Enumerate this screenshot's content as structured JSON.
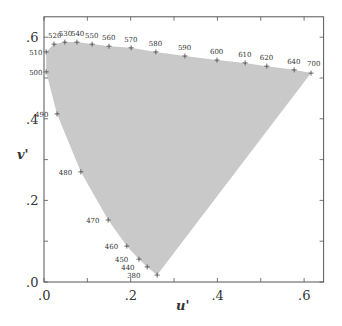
{
  "chart_data": {
    "type": "area",
    "title": "",
    "xlabel": "u'",
    "ylabel": "v'",
    "xlim": [
      0.0,
      0.645
    ],
    "ylim": [
      0.0,
      0.65
    ],
    "grid": false,
    "legend": null,
    "fill_color": "#c8c9c8",
    "x_ticks": [
      {
        "value": 0.0,
        "label": ".0"
      },
      {
        "value": 0.1,
        "label": ""
      },
      {
        "value": 0.2,
        "label": ".2"
      },
      {
        "value": 0.3,
        "label": ""
      },
      {
        "value": 0.4,
        "label": ".4"
      },
      {
        "value": 0.5,
        "label": ""
      },
      {
        "value": 0.6,
        "label": ".6"
      }
    ],
    "y_ticks": [
      {
        "value": 0.0,
        "label": ".0"
      },
      {
        "value": 0.1,
        "label": ""
      },
      {
        "value": 0.2,
        "label": ".2"
      },
      {
        "value": 0.3,
        "label": ""
      },
      {
        "value": 0.4,
        "label": ".4"
      },
      {
        "value": 0.5,
        "label": ""
      },
      {
        "value": 0.6,
        "label": ".6"
      }
    ],
    "spectral_locus": [
      {
        "label": "380",
        "u": 0.261,
        "v": 0.017,
        "lx": -30,
        "ly": 3
      },
      {
        "label": "440",
        "u": 0.238,
        "v": 0.037,
        "lx": -26,
        "ly": 3
      },
      {
        "label": "450",
        "u": 0.219,
        "v": 0.056,
        "lx": -24,
        "ly": 3
      },
      {
        "label": "460",
        "u": 0.191,
        "v": 0.088,
        "lx": -22,
        "ly": 3
      },
      {
        "label": "470",
        "u": 0.148,
        "v": 0.152,
        "lx": -22,
        "ly": 3
      },
      {
        "label": "480",
        "u": 0.085,
        "v": 0.27,
        "lx": -22,
        "ly": 3
      },
      {
        "label": "490",
        "u": 0.03,
        "v": 0.412,
        "lx": -22,
        "ly": 3
      },
      {
        "label": "500",
        "u": 0.005,
        "v": 0.515,
        "lx": -17,
        "ly": 3
      },
      {
        "label": "510",
        "u": 0.005,
        "v": 0.564,
        "lx": -17,
        "ly": 3
      },
      {
        "label": "520",
        "u": 0.023,
        "v": 0.583,
        "lx": -6,
        "ly": -6
      },
      {
        "label": "530",
        "u": 0.048,
        "v": 0.588,
        "lx": -6,
        "ly": -6
      },
      {
        "label": "540",
        "u": 0.076,
        "v": 0.588,
        "lx": -6,
        "ly": -6
      },
      {
        "label": "550",
        "u": 0.111,
        "v": 0.583,
        "lx": -7,
        "ly": -6
      },
      {
        "label": "560",
        "u": 0.15,
        "v": 0.578,
        "lx": -7,
        "ly": -6
      },
      {
        "label": "570",
        "u": 0.201,
        "v": 0.574,
        "lx": -7,
        "ly": -6
      },
      {
        "label": "580",
        "u": 0.258,
        "v": 0.564,
        "lx": -7,
        "ly": -6
      },
      {
        "label": "590",
        "u": 0.325,
        "v": 0.554,
        "lx": -7,
        "ly": -6
      },
      {
        "label": "600",
        "u": 0.399,
        "v": 0.544,
        "lx": -7,
        "ly": -6
      },
      {
        "label": "610",
        "u": 0.464,
        "v": 0.537,
        "lx": -7,
        "ly": -6
      },
      {
        "label": "620",
        "u": 0.514,
        "v": 0.529,
        "lx": -7,
        "ly": -6
      },
      {
        "label": "640",
        "u": 0.577,
        "v": 0.52,
        "lx": -7,
        "ly": -6
      },
      {
        "label": "700",
        "u": 0.616,
        "v": 0.512,
        "lx": -4,
        "ly": -7
      }
    ]
  }
}
